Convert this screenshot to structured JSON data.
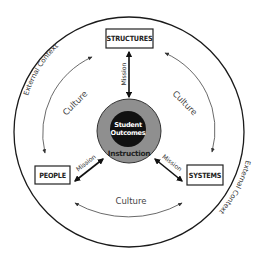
{
  "diagram": {
    "outer_ring": {
      "label_top_left": "External Context",
      "label_bottom_right": "External Context"
    },
    "nodes": {
      "structures": "STRUCTURES",
      "people": "PEOPLE",
      "systems": "SYSTEMS"
    },
    "core": {
      "inner_line1": "Student",
      "inner_line2": "Outcomes",
      "outer": "Instruction"
    },
    "links": {
      "mission_top": "Mission",
      "mission_left": "Mission",
      "mission_right": "Mission",
      "culture_left": "Culture",
      "culture_right": "Culture",
      "culture_bottom": "Culture"
    },
    "colors": {
      "stroke": "#222222",
      "core_gray": "#8f8f8f",
      "core_black": "#111111",
      "background": "#ffffff"
    }
  }
}
